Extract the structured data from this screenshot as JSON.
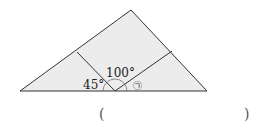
{
  "figure": {
    "angle_left": "45°",
    "angle_top": "100°",
    "angle_unknown": "㉠",
    "colors": {
      "fill": "#ececec",
      "stroke": "#333333"
    }
  },
  "answer": {
    "open_paren": "(",
    "close_paren": ")"
  }
}
